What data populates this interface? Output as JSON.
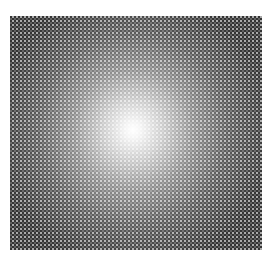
{
  "image": {
    "description": "Halftone checkerboard square with a radial white glow at the center",
    "width": 271,
    "height": 270,
    "background_color": "#ffffff",
    "pattern": {
      "left": 10,
      "top": 16,
      "width": 252,
      "height": 234,
      "base_color": "#4a4a4a",
      "light_cell_color": "#bdbdbd",
      "cell_size_px": 2
    },
    "glow": {
      "center_x": 133,
      "center_y": 130,
      "color": "#ffffff"
    }
  }
}
